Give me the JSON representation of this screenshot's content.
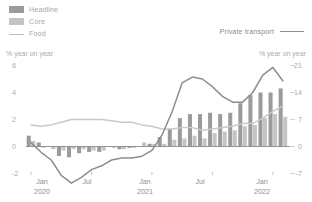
{
  "legend": {
    "left_items": [
      {
        "label": "Headline",
        "marker": "bar-swatch-dark",
        "color": "#9b9b9b"
      },
      {
        "label": "Core",
        "marker": "bar-swatch-light",
        "color": "#c4c4c4"
      },
      {
        "label": "Food",
        "marker": "line",
        "color": "#bdbdbd"
      }
    ],
    "right_items": [
      {
        "label": "Private transport",
        "marker": "line",
        "color": "#8d8d8d"
      }
    ]
  },
  "axes": {
    "left_caption": "% year on year",
    "right_caption": "% year on year",
    "left_ticks": [
      "6",
      "4",
      "2",
      "0",
      "-2"
    ],
    "right_ticks": [
      "21",
      "14",
      "7",
      "0",
      "-7"
    ],
    "x_labels": [
      {
        "month": "Jan",
        "year": "2020"
      },
      {
        "month": "Jul",
        "year": ""
      },
      {
        "month": "Jan",
        "year": "2021"
      },
      {
        "month": "Jul",
        "year": ""
      },
      {
        "month": "Jan",
        "year": "2022"
      }
    ]
  },
  "chart_data": {
    "type": "bar",
    "title": "",
    "xlabel": "",
    "ylabel": "% year on year",
    "ylim": [
      -3,
      7
    ],
    "y2lim": [
      -10.5,
      24.5
    ],
    "yticks": [
      6,
      4,
      2,
      0,
      -2
    ],
    "y2ticks": [
      21,
      14,
      7,
      0,
      -7
    ],
    "grid": false,
    "legend_position": "top-left / top-right",
    "x": [
      "2020-01",
      "2020-02",
      "2020-03",
      "2020-04",
      "2020-05",
      "2020-06",
      "2020-07",
      "2020-08",
      "2020-09",
      "2020-10",
      "2020-11",
      "2020-12",
      "2021-01",
      "2021-02",
      "2021-03",
      "2021-04",
      "2021-05",
      "2021-06",
      "2021-07",
      "2021-08",
      "2021-09",
      "2021-10",
      "2021-11",
      "2021-12",
      "2022-01",
      "2022-02"
    ],
    "x_tick_positions": [
      "2020-01",
      "2020-07",
      "2021-01",
      "2021-07",
      "2022-01"
    ],
    "series": [
      {
        "name": "Headline",
        "type": "bar",
        "axis": "left",
        "color": "#9b9b9b",
        "values": [
          0.8,
          0.3,
          0.0,
          -0.7,
          -0.8,
          -0.5,
          -0.4,
          -0.4,
          0.0,
          -0.2,
          -0.1,
          0.0,
          0.2,
          0.7,
          1.3,
          2.1,
          2.4,
          2.4,
          2.5,
          2.4,
          2.5,
          3.2,
          3.8,
          4.0,
          4.0,
          4.3
        ]
      },
      {
        "name": "Core",
        "type": "bar",
        "axis": "left",
        "color": "#c5c5c5",
        "values": [
          0.4,
          -0.1,
          -0.2,
          -0.3,
          -0.2,
          -0.2,
          -0.3,
          -0.3,
          -0.1,
          -0.2,
          -0.1,
          0.3,
          0.2,
          0.2,
          0.5,
          0.6,
          0.8,
          0.6,
          1.0,
          1.1,
          1.2,
          1.5,
          1.6,
          2.1,
          2.4,
          2.2
        ]
      },
      {
        "name": "Food",
        "type": "line",
        "axis": "left",
        "color": "#c9c9c9",
        "values": [
          1.6,
          1.5,
          1.6,
          1.8,
          2.0,
          2.0,
          2.0,
          2.0,
          1.9,
          1.8,
          1.8,
          1.6,
          1.5,
          1.3,
          1.3,
          1.4,
          1.4,
          1.2,
          1.3,
          1.4,
          1.5,
          1.7,
          1.7,
          2.1,
          2.6,
          3.0
        ]
      },
      {
        "name": "Private transport",
        "type": "line",
        "axis": "right",
        "color": "#8d8d8d",
        "values": [
          1.0,
          -1.5,
          -3.5,
          -7.5,
          -9.5,
          -8.0,
          -6.0,
          -5.0,
          -3.5,
          -3.0,
          -3.0,
          -2.5,
          -1.0,
          3.0,
          9.0,
          16.5,
          18.0,
          17.5,
          15.5,
          13.0,
          11.5,
          11.5,
          14.0,
          18.5,
          20.5,
          17.0
        ]
      }
    ]
  }
}
